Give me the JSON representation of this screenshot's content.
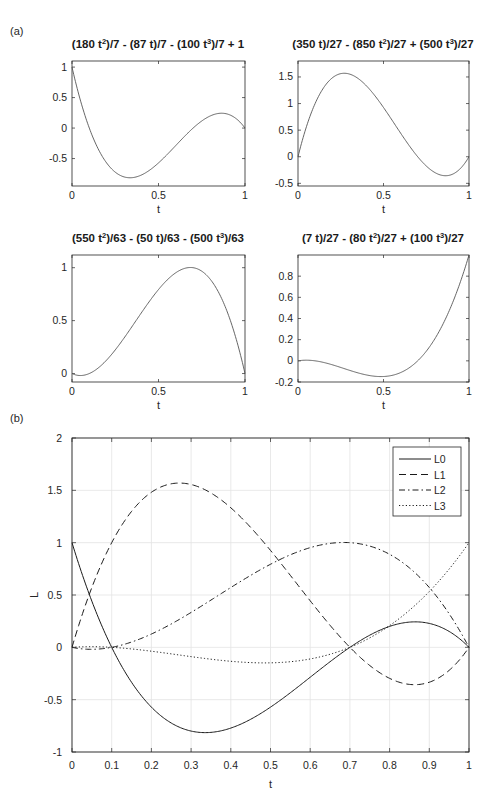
{
  "panels": {
    "a_label": "(a)",
    "b_label": "(b)"
  },
  "chart_data": [
    {
      "type": "line",
      "id": "L0",
      "title": "(180 t²)/7 - (87 t)/7 - (100 t³)/7 + 1",
      "title_parts": [
        "(180 t",
        "2",
        ")/7 - (87 t)/7 - (100 t",
        "3",
        ")/7 + 1"
      ],
      "xlabel": "t",
      "ylabel": "",
      "xlim": [
        0,
        1
      ],
      "ylim": [
        -0.95,
        1.1
      ],
      "xticks": [
        "0",
        "0.5",
        "1"
      ],
      "yticks": [
        "1",
        "0.5",
        "0",
        "-0.5"
      ],
      "ytick_values": [
        1,
        0.5,
        0,
        -0.5
      ],
      "grid": false,
      "coefficients": {
        "c0": 1,
        "c1": -12.428571,
        "c2": 25.714286,
        "c3": -14.285714
      },
      "x": [
        0,
        0.1,
        0.2,
        0.3,
        0.333,
        0.4,
        0.5,
        0.6,
        0.7,
        0.8,
        0.867,
        0.9,
        1
      ],
      "values": [
        1,
        0,
        -0.57,
        -0.82,
        -0.83,
        -0.78,
        -0.5,
        -0.15,
        0,
        0.18,
        0.24,
        0.23,
        0
      ]
    },
    {
      "type": "line",
      "id": "L1",
      "title": "(350 t)/27 - (850 t²)/27 + (500 t³)/27",
      "title_parts": [
        "(350 t)/27 - (850 t",
        "2",
        ")/27 + (500 t",
        "3",
        ")/27"
      ],
      "xlabel": "t",
      "ylabel": "",
      "xlim": [
        0,
        1
      ],
      "ylim": [
        -0.55,
        1.8
      ],
      "xticks": [
        "0",
        "0.5",
        "1"
      ],
      "yticks": [
        "1.5",
        "1",
        "0.5",
        "0",
        "-0.5"
      ],
      "ytick_values": [
        1.5,
        1,
        0.5,
        0,
        -0.5
      ],
      "grid": false,
      "coefficients": {
        "c0": 0,
        "c1": 12.962963,
        "c2": -31.481481,
        "c3": 18.518519
      },
      "x": [
        0,
        0.1,
        0.2,
        0.277,
        0.3,
        0.4,
        0.5,
        0.6,
        0.7,
        0.8,
        0.866,
        0.9,
        1
      ],
      "values": [
        0,
        0.99,
        1.48,
        1.57,
        1.55,
        1.31,
        0.93,
        0.5,
        0,
        -0.3,
        -0.36,
        -0.34,
        0
      ]
    },
    {
      "type": "line",
      "id": "L2",
      "title": "(550 t²)/63 - (50 t)/63 - (500 t³)/63",
      "title_parts": [
        "(550 t",
        "2",
        ")/63 - (50 t)/63 - (500 t",
        "3",
        ")/63"
      ],
      "xlabel": "t",
      "ylabel": "",
      "xlim": [
        0,
        1
      ],
      "ylim": [
        -0.08,
        1.12
      ],
      "xticks": [
        "0",
        "0.5",
        "1"
      ],
      "yticks": [
        "1",
        "0.5",
        "0"
      ],
      "ytick_values": [
        1,
        0.5,
        0
      ],
      "grid": false,
      "coefficients": {
        "c0": 0,
        "c1": -0.793651,
        "c2": 8.730159,
        "c3": -7.936508
      },
      "x": [
        0,
        0.05,
        0.1,
        0.2,
        0.3,
        0.4,
        0.5,
        0.6,
        0.7,
        0.8,
        0.9,
        1
      ],
      "values": [
        0,
        -0.02,
        0,
        0.21,
        0.33,
        0.57,
        0.79,
        0.95,
        1.0,
        0.88,
        0.57,
        0
      ]
    },
    {
      "type": "line",
      "id": "L3",
      "title": "(7 t)/27 - (80 t²)/27 + (100 t³)/27",
      "title_parts": [
        "(7 t)/27 - (80 t",
        "2",
        ")/27 + (100 t",
        "3",
        ")/27"
      ],
      "xlabel": "t",
      "ylabel": "",
      "xlim": [
        0,
        1
      ],
      "ylim": [
        -0.2,
        1.0
      ],
      "xticks": [
        "0",
        "0.5",
        "1"
      ],
      "yticks": [
        "0.8",
        "0.6",
        "0.4",
        "0.2",
        "0",
        "-0.2"
      ],
      "ytick_values": [
        0.8,
        0.6,
        0.4,
        0.2,
        0,
        -0.2
      ],
      "grid": false,
      "coefficients": {
        "c0": 0,
        "c1": 0.259259,
        "c2": -2.962963,
        "c3": 3.703704
      },
      "x": [
        0,
        0.1,
        0.2,
        0.3,
        0.4,
        0.5,
        0.6,
        0.7,
        0.8,
        0.9,
        1
      ],
      "values": [
        0,
        0,
        -0.04,
        -0.09,
        -0.13,
        -0.15,
        -0.11,
        0,
        0.21,
        0.52,
        1
      ]
    },
    {
      "type": "line",
      "id": "combined",
      "title": "",
      "xlabel": "t",
      "ylabel": "L",
      "xlim": [
        0,
        1
      ],
      "ylim": [
        -1,
        2
      ],
      "xticks": [
        "0",
        "0.1",
        "0.2",
        "0.3",
        "0.4",
        "0.5",
        "0.6",
        "0.7",
        "0.8",
        "0.9",
        "1"
      ],
      "yticks": [
        "2",
        "1.5",
        "1",
        "0.5",
        "0",
        "-0.5",
        "-1"
      ],
      "ytick_values": [
        2,
        1.5,
        1,
        0.5,
        0,
        -0.5,
        -1
      ],
      "grid": true,
      "legend": {
        "position": "northeast",
        "entries": [
          "L0",
          "L1",
          "L2",
          "L3"
        ],
        "styles": [
          "solid",
          "dashed",
          "dashdot",
          "dotted"
        ]
      },
      "series": [
        {
          "name": "L0",
          "style": "solid",
          "coefficients": [
            1,
            -12.428571,
            25.714286,
            -14.285714
          ]
        },
        {
          "name": "L1",
          "style": "dashed",
          "coefficients": [
            0,
            12.962963,
            -31.481481,
            18.518519
          ]
        },
        {
          "name": "L2",
          "style": "dashdot",
          "coefficients": [
            0,
            -0.793651,
            8.730159,
            -7.936508
          ]
        },
        {
          "name": "L3",
          "style": "dotted",
          "coefficients": [
            0,
            0.259259,
            -2.962963,
            3.703704
          ]
        }
      ]
    }
  ]
}
